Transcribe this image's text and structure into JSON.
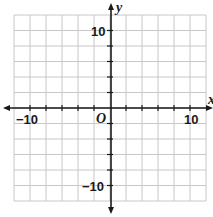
{
  "chart_data": {
    "type": "scatter",
    "title": "",
    "xlabel": "x",
    "ylabel": "y",
    "origin_label": "O",
    "xlim": [
      -12,
      12
    ],
    "ylim": [
      -12,
      12
    ],
    "grid": true,
    "grid_step": 2,
    "tick_step": 2,
    "x_tick_labels": [
      {
        "value": -10,
        "label": "−10"
      },
      {
        "value": 10,
        "label": "10"
      }
    ],
    "y_tick_labels": [
      {
        "value": 10,
        "label": "10"
      },
      {
        "value": -10,
        "label": "−10"
      }
    ],
    "series": [],
    "colors": {
      "grid": "#c8c8c8",
      "axis": "#1a1a1a",
      "background": "#ffffff"
    }
  }
}
